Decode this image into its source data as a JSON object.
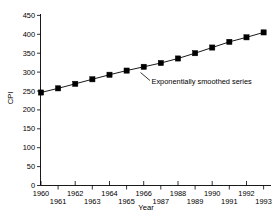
{
  "chart_data": {
    "type": "line",
    "title": "",
    "subtitle": "",
    "xlabel": "Year",
    "ylabel": "CPI",
    "xlim": [
      1960,
      1993
    ],
    "ylim": [
      0,
      450
    ],
    "grid": false,
    "legend": null,
    "marker": "square",
    "color": "#000000",
    "categories": [
      1960,
      1961,
      1962,
      1963,
      1964,
      1965,
      1966,
      1967,
      1968,
      1969,
      1970,
      1971,
      1972,
      1973
    ],
    "x": [
      1960,
      1961,
      1962,
      1963,
      1964,
      1965,
      1966,
      1967,
      1968,
      1969,
      1970,
      1971,
      1972,
      1973
    ],
    "x_display": [
      "1960",
      "1961",
      "1962",
      "1963",
      "1964",
      "1965",
      "1966",
      "1967",
      "1968",
      "1989",
      "1990",
      "1991",
      "1992",
      "1993"
    ],
    "values": [
      246,
      257,
      269,
      281,
      293,
      304,
      314,
      324,
      336,
      350,
      365,
      380,
      392,
      405
    ],
    "series": [
      {
        "name": "Exponentially smoothed series",
        "values": [
          246,
          257,
          269,
          281,
          293,
          304,
          314,
          324,
          336,
          350,
          365,
          380,
          392,
          405
        ]
      }
    ],
    "ytick_labels": [
      "0",
      "50",
      "100",
      "150",
      "200",
      "250",
      "300",
      "350",
      "400",
      "450"
    ],
    "ytick_values": [
      0,
      50,
      100,
      150,
      200,
      250,
      300,
      350,
      400,
      450
    ],
    "xtick_labels": [
      "1960",
      "1961",
      "1962",
      "1963",
      "1964",
      "1965",
      "1966",
      "1987",
      "1988",
      "1989",
      "1990",
      "1991",
      "1992",
      "1993"
    ],
    "xtick_values": [
      1960,
      1961,
      1962,
      1963,
      1964,
      1965,
      1966,
      1987,
      1988,
      1989,
      1990,
      1991,
      1992,
      1993
    ],
    "xtick_rows": [
      0,
      1,
      0,
      1,
      0,
      1,
      0,
      1,
      0,
      1,
      0,
      1,
      0,
      1
    ],
    "annotations": [
      {
        "text": "Exponentially smoothed series",
        "x": 1986,
        "y": 314
      }
    ]
  },
  "axes": {
    "ylabel": "CPI",
    "xlabel": "Year"
  },
  "annotation": {
    "label": "Exponentially smoothed series"
  }
}
